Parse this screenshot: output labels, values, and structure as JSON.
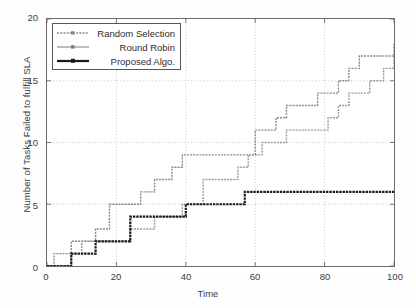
{
  "chart_data": {
    "type": "line",
    "title": "",
    "xlabel": "Time",
    "ylabel": "Number of Tasks Failed to fulfill SLA",
    "xlim": [
      0,
      100
    ],
    "ylim": [
      0,
      20
    ],
    "xticks": [
      0,
      20,
      40,
      60,
      80,
      100
    ],
    "yticks": [
      0,
      5,
      10,
      15,
      20
    ],
    "grid": true,
    "legend_position": "upper left",
    "drawstyle": "steps-post",
    "series": [
      {
        "name": "Random Selection",
        "color": "#8a8a8a",
        "linewidth": 1.4,
        "x": [
          0,
          2,
          5,
          7,
          11,
          14,
          18,
          24,
          27,
          31,
          36,
          39,
          42,
          45,
          51,
          57,
          60,
          63,
          66,
          69,
          75,
          78,
          81,
          84,
          87,
          90,
          96,
          100
        ],
        "y": [
          0,
          1,
          1,
          2,
          2,
          3,
          5,
          5,
          6,
          7,
          8,
          9,
          9,
          9,
          9,
          9,
          11,
          11,
          12,
          13,
          13,
          14,
          14,
          15,
          16,
          17,
          17,
          18
        ]
      },
      {
        "name": "Round Robin",
        "color": "#9a9a9a",
        "linewidth": 1.4,
        "x": [
          0,
          3,
          7,
          10,
          14,
          20,
          24,
          27,
          31,
          36,
          39,
          42,
          45,
          48,
          51,
          55,
          58,
          62,
          66,
          69,
          73,
          78,
          81,
          84,
          87,
          90,
          93,
          97,
          100
        ],
        "y": [
          0,
          0,
          1,
          2,
          2,
          2,
          3,
          3,
          4,
          4,
          5,
          5,
          7,
          7,
          7,
          8,
          9,
          10,
          10,
          11,
          11,
          11,
          12,
          13,
          14,
          14,
          15,
          16,
          17
        ]
      },
      {
        "name": "Proposed Algo.",
        "color": "#1a1a1a",
        "linewidth": 2.2,
        "x": [
          0,
          4,
          7,
          10,
          14,
          18,
          21,
          24,
          28,
          32,
          36,
          40,
          44,
          48,
          52,
          57,
          62,
          70,
          80,
          90,
          100
        ],
        "y": [
          0,
          0,
          1,
          1,
          2,
          2,
          2,
          4,
          4,
          4,
          4,
          5,
          5,
          5,
          5,
          6,
          6,
          6,
          6,
          6,
          6
        ]
      }
    ]
  },
  "legend": {
    "items": [
      {
        "label": "Random Selection",
        "style": "dotted-gray"
      },
      {
        "label": "Round Robin",
        "style": "gray-marker"
      },
      {
        "label": "Proposed Algo.",
        "style": "thick-black"
      }
    ]
  },
  "axes": {
    "y_tick_labels": [
      "0",
      "5",
      "10",
      "15",
      "20"
    ],
    "x_tick_labels": [
      "0",
      "20",
      "40",
      "60",
      "80",
      "100"
    ],
    "y_axis_title": "Number of Tasks Failed to fulfill SLA",
    "x_axis_title": "Time"
  }
}
